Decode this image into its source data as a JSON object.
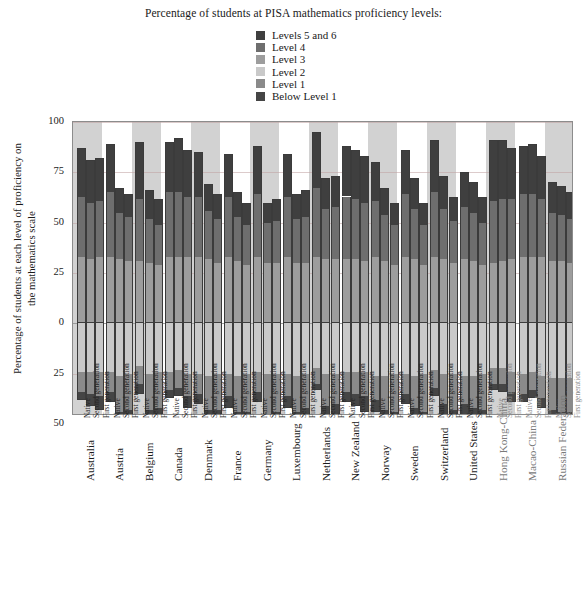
{
  "legend": {
    "title": "Percentage of students at PISA mathematics proficiency levels:",
    "items": [
      {
        "label": "Levels 5 and 6",
        "color": "#3f3f3f"
      },
      {
        "label": "Level 4",
        "color": "#6e6e6e"
      },
      {
        "label": "Level 3",
        "color": "#9d9d9d"
      },
      {
        "label": "Level 2",
        "color": "#c9c9c9"
      },
      {
        "label": "Level 1",
        "color": "#8a8a8a"
      },
      {
        "label": "Below Level 1",
        "color": "#454545"
      }
    ]
  },
  "axes": {
    "y_title": "Percentage of students at each level of proficiency on the mathematics scale",
    "y_ticks": [
      "100",
      "75",
      "50",
      "25",
      "0",
      "25",
      "50"
    ],
    "y_tick_values": [
      100,
      75,
      50,
      25,
      0,
      -25,
      -50
    ],
    "y_top": 100,
    "y_bottom": -46,
    "group_sublabels": [
      "Native",
      "Second generation",
      "First generation"
    ]
  },
  "chart_data": {
    "type": "bar",
    "title": "Percentage of students at PISA mathematics proficiency levels:",
    "xlabel": "",
    "ylabel": "Percentage of students at each level of proficiency on the mathematics scale",
    "ylim": [
      -46,
      100
    ],
    "grid": true,
    "legend_position": "top-center",
    "stacking": "diverging",
    "above_zero_levels": [
      "Level 3",
      "Level 4",
      "Levels 5 and 6"
    ],
    "below_zero_levels": [
      "Level 2",
      "Level 1",
      "Below Level 1"
    ],
    "categories": [
      "Australia",
      "Austria",
      "Belgium",
      "Canada",
      "Denmark",
      "France",
      "Germany",
      "Luxembourg",
      "Netherlands",
      "New Zealand",
      "Norway",
      "Sweden",
      "Switzerland",
      "United States",
      "Hong Kong-China",
      "Macao-China",
      "Russian Federation"
    ],
    "subcategories": [
      "Native",
      "Second generation",
      "First generation"
    ],
    "groups": [
      {
        "category": "Australia",
        "dim": false,
        "bars": [
          {
            "sub": "Native",
            "l3": 33,
            "l4": 30,
            "l56": 24,
            "l2": 24,
            "l1": 10,
            "below": 4
          },
          {
            "sub": "Second generation",
            "l3": 32,
            "l4": 28,
            "l56": 21,
            "l2": 24,
            "l1": 11,
            "below": 6
          },
          {
            "sub": "First generation",
            "l3": 33,
            "l4": 28,
            "l56": 21,
            "l2": 24,
            "l1": 12,
            "below": 7
          }
        ]
      },
      {
        "category": "Austria",
        "dim": false,
        "bars": [
          {
            "sub": "Native",
            "l3": 33,
            "l4": 32,
            "l56": 24,
            "l2": 24,
            "l1": 10,
            "below": 5
          },
          {
            "sub": "Second generation",
            "l3": 32,
            "l4": 23,
            "l56": 12,
            "l2": 26,
            "l1": 18,
            "below": 15
          },
          {
            "sub": "First generation",
            "l3": 31,
            "l4": 22,
            "l56": 11,
            "l2": 25,
            "l1": 18,
            "below": 18
          }
        ]
      },
      {
        "category": "Belgium",
        "dim": false,
        "bars": [
          {
            "sub": "Native",
            "l3": 31,
            "l4": 31,
            "l56": 28,
            "l2": 21,
            "l1": 9,
            "below": 5
          },
          {
            "sub": "Second generation",
            "l3": 30,
            "l4": 22,
            "l56": 14,
            "l2": 25,
            "l1": 18,
            "below": 16
          },
          {
            "sub": "First generation",
            "l3": 29,
            "l4": 20,
            "l56": 13,
            "l2": 24,
            "l1": 18,
            "below": 18
          }
        ]
      },
      {
        "category": "Canada",
        "dim": false,
        "bars": [
          {
            "sub": "Native",
            "l3": 33,
            "l4": 32,
            "l56": 25,
            "l2": 24,
            "l1": 9,
            "below": 4
          },
          {
            "sub": "Second generation",
            "l3": 33,
            "l4": 32,
            "l56": 27,
            "l2": 23,
            "l1": 9,
            "below": 4
          },
          {
            "sub": "First generation",
            "l3": 33,
            "l4": 30,
            "l56": 23,
            "l2": 25,
            "l1": 11,
            "below": 6
          }
        ]
      },
      {
        "category": "Denmark",
        "dim": false,
        "bars": [
          {
            "sub": "Native",
            "l3": 33,
            "l4": 30,
            "l56": 22,
            "l2": 25,
            "l1": 10,
            "below": 5
          },
          {
            "sub": "Second generation",
            "l3": 32,
            "l4": 24,
            "l56": 13,
            "l2": 26,
            "l1": 17,
            "below": 13
          },
          {
            "sub": "First generation",
            "l3": 30,
            "l4": 22,
            "l56": 12,
            "l2": 25,
            "l1": 18,
            "below": 16
          }
        ]
      },
      {
        "category": "France",
        "dim": false,
        "bars": [
          {
            "sub": "Native",
            "l3": 33,
            "l4": 30,
            "l56": 21,
            "l2": 25,
            "l1": 11,
            "below": 6
          },
          {
            "sub": "Second generation",
            "l3": 31,
            "l4": 22,
            "l56": 12,
            "l2": 26,
            "l1": 18,
            "below": 15
          },
          {
            "sub": "First generation",
            "l3": 29,
            "l4": 20,
            "l56": 11,
            "l2": 25,
            "l1": 19,
            "below": 18
          }
        ]
      },
      {
        "category": "Germany",
        "dim": false,
        "bars": [
          {
            "sub": "Native",
            "l3": 33,
            "l4": 31,
            "l56": 24,
            "l2": 24,
            "l1": 10,
            "below": 5
          },
          {
            "sub": "Second generation",
            "l3": 30,
            "l4": 20,
            "l56": 10,
            "l2": 25,
            "l1": 20,
            "below": 19
          },
          {
            "sub": "First generation",
            "l3": 30,
            "l4": 21,
            "l56": 11,
            "l2": 25,
            "l1": 19,
            "below": 17
          }
        ]
      },
      {
        "category": "Luxembourg",
        "dim": false,
        "bars": [
          {
            "sub": "Native",
            "l3": 33,
            "l4": 30,
            "l56": 21,
            "l2": 25,
            "l1": 11,
            "below": 6
          },
          {
            "sub": "Second generation",
            "l3": 30,
            "l4": 22,
            "l56": 12,
            "l2": 26,
            "l1": 18,
            "below": 16
          },
          {
            "sub": "First generation",
            "l3": 30,
            "l4": 23,
            "l56": 13,
            "l2": 25,
            "l1": 17,
            "below": 15
          }
        ]
      },
      {
        "category": "Netherlands",
        "dim": false,
        "bars": [
          {
            "sub": "Native",
            "l3": 33,
            "l4": 34,
            "l56": 28,
            "l2": 22,
            "l1": 8,
            "below": 3
          },
          {
            "sub": "Second generation",
            "l3": 32,
            "l4": 25,
            "l56": 15,
            "l2": 25,
            "l1": 16,
            "below": 12
          },
          {
            "sub": "First generation",
            "l3": 32,
            "l4": 26,
            "l56": 15,
            "l2": 25,
            "l1": 15,
            "below": 11
          }
        ]
      },
      {
        "category": "New Zealand",
        "dim": false,
        "bars": [
          {
            "sub": "Native",
            "l3": 32,
            "l4": 31,
            "l56": 25,
            "l2": 24,
            "l1": 10,
            "below": 5
          },
          {
            "sub": "Second generation",
            "l3": 32,
            "l4": 30,
            "l56": 24,
            "l2": 24,
            "l1": 11,
            "below": 6
          },
          {
            "sub": "First generation",
            "l3": 31,
            "l4": 29,
            "l56": 23,
            "l2": 24,
            "l1": 12,
            "below": 8
          }
        ]
      },
      {
        "category": "Norway",
        "dim": false,
        "bars": [
          {
            "sub": "Native",
            "l3": 33,
            "l4": 28,
            "l56": 19,
            "l2": 26,
            "l1": 12,
            "below": 6
          },
          {
            "sub": "Second generation",
            "l3": 31,
            "l4": 23,
            "l56": 13,
            "l2": 26,
            "l1": 17,
            "below": 14
          },
          {
            "sub": "First generation",
            "l3": 29,
            "l4": 20,
            "l56": 11,
            "l2": 25,
            "l1": 19,
            "below": 18
          }
        ]
      },
      {
        "category": "Sweden",
        "dim": false,
        "bars": [
          {
            "sub": "Native",
            "l3": 33,
            "l4": 31,
            "l56": 22,
            "l2": 25,
            "l1": 10,
            "below": 5
          },
          {
            "sub": "Second generation",
            "l3": 32,
            "l4": 25,
            "l56": 15,
            "l2": 26,
            "l1": 16,
            "below": 12
          },
          {
            "sub": "First generation",
            "l3": 29,
            "l4": 20,
            "l56": 11,
            "l2": 25,
            "l1": 19,
            "below": 19
          }
        ]
      },
      {
        "category": "Switzerland",
        "dim": false,
        "bars": [
          {
            "sub": "Native",
            "l3": 33,
            "l4": 32,
            "l56": 26,
            "l2": 23,
            "l1": 9,
            "below": 4
          },
          {
            "sub": "Second generation",
            "l3": 32,
            "l4": 25,
            "l56": 16,
            "l2": 25,
            "l1": 15,
            "below": 11
          },
          {
            "sub": "First generation",
            "l3": 30,
            "l4": 21,
            "l56": 12,
            "l2": 25,
            "l1": 18,
            "below": 16
          }
        ]
      },
      {
        "category": "United States",
        "dim": false,
        "bars": [
          {
            "sub": "Native",
            "l3": 32,
            "l4": 26,
            "l56": 17,
            "l2": 26,
            "l1": 14,
            "below": 9
          },
          {
            "sub": "Second generation",
            "l3": 31,
            "l4": 24,
            "l56": 15,
            "l2": 26,
            "l1": 16,
            "below": 12
          },
          {
            "sub": "First generation",
            "l3": 29,
            "l4": 21,
            "l56": 13,
            "l2": 25,
            "l1": 18,
            "below": 17
          }
        ]
      },
      {
        "category": "Hong Kong-China",
        "dim": true,
        "bars": [
          {
            "sub": "Native",
            "l3": 30,
            "l4": 31,
            "l56": 30,
            "l2": 22,
            "l1": 8,
            "below": 3
          },
          {
            "sub": "Second generation",
            "l3": 31,
            "l4": 31,
            "l56": 29,
            "l2": 22,
            "l1": 8,
            "below": 4
          },
          {
            "sub": "First generation",
            "l3": 32,
            "l4": 30,
            "l56": 25,
            "l2": 24,
            "l1": 10,
            "below": 5
          }
        ]
      },
      {
        "category": "Macao-China",
        "dim": true,
        "bars": [
          {
            "sub": "Native",
            "l3": 33,
            "l4": 31,
            "l56": 24,
            "l2": 25,
            "l1": 10,
            "below": 4
          },
          {
            "sub": "Second generation",
            "l3": 33,
            "l4": 31,
            "l56": 25,
            "l2": 24,
            "l1": 9,
            "below": 4
          },
          {
            "sub": "First generation",
            "l3": 33,
            "l4": 29,
            "l56": 21,
            "l2": 26,
            "l1": 11,
            "below": 5
          }
        ]
      },
      {
        "category": "Russian Federation",
        "dim": true,
        "bars": [
          {
            "sub": "Native",
            "l3": 31,
            "l4": 24,
            "l56": 15,
            "l2": 27,
            "l1": 16,
            "below": 12
          },
          {
            "sub": "Second generation",
            "l3": 31,
            "l4": 23,
            "l56": 14,
            "l2": 27,
            "l1": 17,
            "below": 13
          },
          {
            "sub": "First generation",
            "l3": 30,
            "l4": 22,
            "l56": 13,
            "l2": 27,
            "l1": 17,
            "below": 14
          }
        ]
      }
    ]
  }
}
